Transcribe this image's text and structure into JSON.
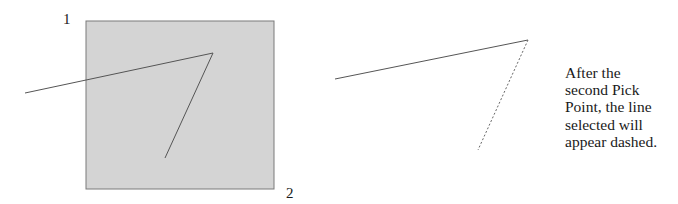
{
  "diagram": {
    "left_panel": {
      "selection_box": {
        "x": 86,
        "y": 21,
        "width": 188,
        "height": 168,
        "fill": "#d4d4d4",
        "stroke": "#7a7a7a"
      },
      "pick_point_labels": [
        {
          "text": "1",
          "x": 63,
          "y": 12
        },
        {
          "text": "2",
          "x": 286,
          "y": 186
        }
      ],
      "polyline": {
        "points": [
          [
            25,
            93
          ],
          [
            213,
            53
          ],
          [
            165,
            158
          ]
        ],
        "stroke": "#555555"
      }
    },
    "right_panel": {
      "solid_line": {
        "from": [
          335,
          79
        ],
        "to": [
          528,
          40
        ],
        "stroke": "#555555"
      },
      "dashed_line": {
        "from": [
          528,
          40
        ],
        "to": [
          478,
          150
        ],
        "stroke": "#666666",
        "dash": "2,2"
      }
    },
    "caption": {
      "lines": [
        "After the",
        "second Pick",
        "Point, the line",
        "selected will",
        "appear dashed."
      ]
    }
  }
}
